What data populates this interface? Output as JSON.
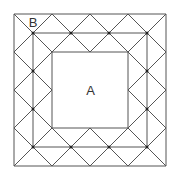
{
  "diagram": {
    "labels": {
      "inner_square": "A",
      "corner_triangle": "B"
    },
    "colors": {
      "stroke": "#555555",
      "dot": "#222222",
      "background": "#ffffff"
    },
    "geometry": {
      "origin_x": 14,
      "origin_y": 14,
      "unit": 19,
      "grid_units": 8
    }
  }
}
